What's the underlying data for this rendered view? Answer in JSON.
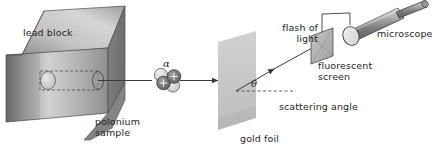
{
  "figure": {
    "background_color": "#ffffff",
    "width": 432,
    "height": 153
  },
  "labels": {
    "lead_block": "lead block",
    "polonium_sample_line1": "polonium",
    "polonium_sample_line2": "sample",
    "alpha_particle": "α",
    "gold_foil": "gold foil",
    "theta": "θ",
    "scattering_angle": "scattering angle",
    "flash_of_light_line1": "flash of",
    "flash_of_light_line2": "light",
    "fluorescent_screen_line1": "fluorescent",
    "fluorescent_screen_line2": "screen",
    "microscope": "microscope"
  },
  "colors": {
    "lead_block_top_light": "#d8d8d8",
    "lead_block_top_dark": "#8e8e8e",
    "lead_block_front_light": "#e2e2e2",
    "lead_block_front_dark": "#6e6e6e",
    "lead_block_side": "#7a7a7a",
    "gold_foil": "#c9c9c9",
    "fluorescent_screen": "#b4b4b4",
    "microscope_body_light": "#cfcfcf",
    "microscope_body_dark": "#6f6f6f",
    "proton": "#6a6a6a",
    "neutron": "#dcdcdc",
    "outline": "#3a3a3a",
    "text": "#262626"
  },
  "components": {
    "lead_block": {
      "name": "lead block",
      "description": "shaded 3D cuboid with internal cavity and collimating channel"
    },
    "polonium_sample": {
      "name": "polonium sample",
      "description": "light ellipse inside the lead block cavity emitting alpha particles"
    },
    "alpha_particle": {
      "name": "alpha particle",
      "symbol": "α",
      "protons": 2,
      "neutrons": 2,
      "proton_charge_symbol": "+"
    },
    "beam": {
      "name": "alpha particle beam",
      "description": "horizontal arrow travelling from lead block to gold foil"
    },
    "gold_foil": {
      "name": "gold foil",
      "description": "thin light-grey parallelogram target"
    },
    "scattered_beam": {
      "name": "scattered alpha path",
      "description": "arrow deflected upward-right from the foil toward the fluorescent screen"
    },
    "scattering_angle": {
      "name": "scattering angle",
      "symbol": "θ",
      "description": "angle between the dashed undeviated path and the scattered path"
    },
    "fluorescent_screen": {
      "name": "fluorescent screen",
      "description": "small grey parallelogram where the alpha particle makes a flash of light"
    },
    "microscope": {
      "name": "microscope",
      "description": "cylindrical tube mounted on a bracket above the fluorescent screen"
    }
  }
}
